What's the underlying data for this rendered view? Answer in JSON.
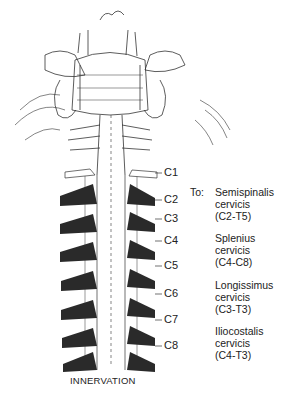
{
  "figure": {
    "caption": "INNERVATION",
    "to_label": "To:",
    "levels": [
      "C1",
      "C2",
      "C3",
      "C4",
      "C5",
      "C6",
      "C7",
      "C8"
    ],
    "muscles": [
      {
        "name": "Semispinalis",
        "part": "cervicis",
        "range": "(C2-T5)"
      },
      {
        "name": "Splenius",
        "part": "cervicis",
        "range": "(C4-C8)"
      },
      {
        "name": "Longissimus",
        "part": "cervicis",
        "range": "(C3-T3)"
      },
      {
        "name": "Iliocostalis",
        "part": "cervicis",
        "range": "(C4-T3)"
      }
    ],
    "colors": {
      "ink": "#222222",
      "nerve_fill": "#2a2a2a",
      "background": "#ffffff"
    }
  }
}
